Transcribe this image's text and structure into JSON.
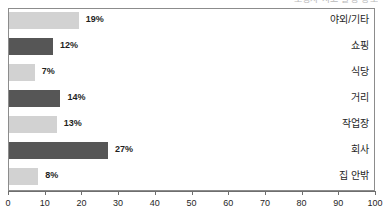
{
  "top_clipped_text": "보행자 사고 발생 장소",
  "chart_data": {
    "type": "bar",
    "orientation": "horizontal",
    "title": "",
    "subtitle": "",
    "xlabel": "",
    "ylabel": "",
    "xlim": [
      0,
      100
    ],
    "xticks": [
      0,
      10,
      20,
      30,
      40,
      50,
      60,
      70,
      80,
      90,
      100
    ],
    "xtick_labels": [
      "0",
      "10",
      "20",
      "30",
      "40",
      "50",
      "60",
      "70",
      "80",
      "90",
      "100"
    ],
    "grid": false,
    "legend": "none",
    "value_suffix": "%",
    "categories": [
      "야외/기타",
      "쇼핑",
      "식당",
      "거리",
      "작업장",
      "회사",
      "집 안밖"
    ],
    "values": [
      19,
      12,
      7,
      14,
      13,
      27,
      8
    ],
    "value_labels": [
      "19%",
      "12%",
      "7%",
      "14%",
      "13%",
      "27%",
      "8%"
    ],
    "bar_colors": [
      "#d2d2d2",
      "#565656",
      "#d2d2d2",
      "#565656",
      "#d2d2d2",
      "#565656",
      "#d2d2d2"
    ],
    "colors": {
      "light_bar": "#d2d2d2",
      "dark_bar": "#565656",
      "frame": "#8c8c8c",
      "axis": "#6e6e6e",
      "text": "#1f1f1f",
      "background": "#ffffff"
    }
  }
}
